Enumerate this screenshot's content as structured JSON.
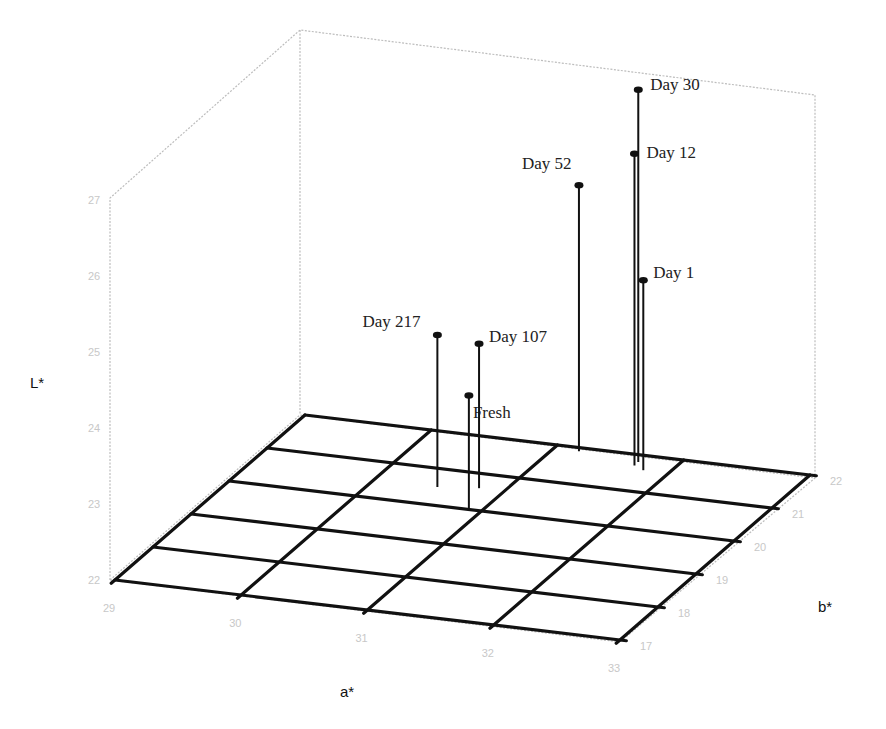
{
  "chart_data": {
    "type": "scatter3d",
    "title": "",
    "xlabel": "a*",
    "ylabel": "b*",
    "zlabel": "L*",
    "x_ticks": [
      "29",
      "30",
      "31",
      "32",
      "33"
    ],
    "y_ticks": [
      "17",
      "18",
      "19",
      "20",
      "21",
      "22"
    ],
    "z_ticks": [
      "22",
      "23",
      "24",
      "25",
      "26",
      "27"
    ],
    "xlim": [
      29,
      33
    ],
    "ylim": [
      17,
      22
    ],
    "zlim": [
      22,
      27
    ],
    "grid": true,
    "legend": null,
    "points": [
      {
        "label": "Fresh",
        "a": 30.9,
        "b": 20.0,
        "L": 23.5
      },
      {
        "label": "Day 1",
        "a": 31.8,
        "b": 21.6,
        "L": 24.5
      },
      {
        "label": "Day 12",
        "a": 31.7,
        "b": 21.7,
        "L": 26.1
      },
      {
        "label": "Day 30",
        "a": 31.7,
        "b": 21.8,
        "L": 26.9
      },
      {
        "label": "Day 52",
        "a": 31.2,
        "b": 21.9,
        "L": 25.5
      },
      {
        "label": "Day 107",
        "a": 30.8,
        "b": 20.6,
        "L": 23.9
      },
      {
        "label": "Day 217",
        "a": 30.5,
        "b": 20.5,
        "L": 24.0
      }
    ]
  }
}
